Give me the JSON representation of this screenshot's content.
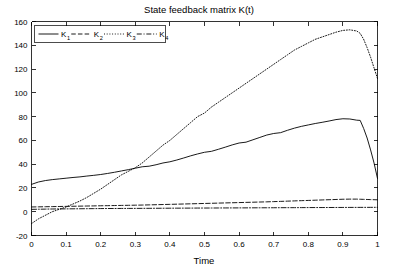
{
  "figure": {
    "width": 398,
    "height": 276,
    "background": "#ffffff",
    "foreground": "#000000"
  },
  "chart_data": {
    "type": "line",
    "title": "State feedback matrix K(t)",
    "xlabel": "Time",
    "ylabel": "",
    "xlim": [
      0,
      1
    ],
    "ylim": [
      -20,
      160
    ],
    "grid": false,
    "legend_position": "upper left",
    "xticks": [
      0,
      0.1,
      0.2,
      0.3,
      0.4,
      0.5,
      0.6,
      0.7,
      0.8,
      0.9,
      1
    ],
    "xticklabels": [
      "0",
      "0.1",
      "0.2",
      "0.3",
      "0.4",
      "0.5",
      "0.6",
      "0.7",
      "0.8",
      "0.9",
      "1"
    ],
    "yticks": [
      -20,
      0,
      20,
      40,
      60,
      80,
      100,
      120,
      140,
      160
    ],
    "yticklabels": [
      "-20",
      "0",
      "20",
      "40",
      "60",
      "80",
      "100",
      "120",
      "140",
      "160"
    ],
    "x": [
      0,
      0.02,
      0.04,
      0.06,
      0.08,
      0.1,
      0.12,
      0.14,
      0.16,
      0.18,
      0.2,
      0.22,
      0.24,
      0.26,
      0.28,
      0.3,
      0.32,
      0.34,
      0.36,
      0.38,
      0.4,
      0.42,
      0.44,
      0.46,
      0.48,
      0.5,
      0.52,
      0.54,
      0.56,
      0.58,
      0.6,
      0.62,
      0.64,
      0.66,
      0.68,
      0.7,
      0.72,
      0.74,
      0.76,
      0.78,
      0.8,
      0.82,
      0.84,
      0.86,
      0.88,
      0.9,
      0.92,
      0.94,
      0.95,
      0.96,
      0.97,
      0.98,
      0.99,
      1
    ],
    "series": [
      {
        "name": "K_1",
        "label": "K",
        "subscript": "1",
        "linestyle": "solid",
        "color": "#000000",
        "values": [
          23,
          25,
          26.2,
          27,
          27.6,
          28.2,
          28.8,
          29.3,
          30,
          30.6,
          31.3,
          32.2,
          33.2,
          34.3,
          35.4,
          36.6,
          37.8,
          38.3,
          39.5,
          41,
          42,
          43.5,
          45.2,
          47,
          48.6,
          50,
          50.8,
          52.5,
          54.3,
          56.2,
          57.8,
          58.5,
          60.5,
          62.5,
          64.5,
          65.8,
          66.5,
          68.5,
          70.3,
          71.8,
          73,
          74.2,
          75.2,
          76.3,
          77.5,
          78.2,
          78,
          77,
          76.8,
          70,
          62,
          52,
          41,
          28
        ]
      },
      {
        "name": "K_2",
        "label": "K",
        "subscript": "2",
        "linestyle": "dashed",
        "color": "#000000",
        "values": [
          4,
          4.1,
          4.2,
          4.3,
          4.4,
          4.5,
          4.6,
          4.7,
          4.8,
          4.9,
          5,
          5.1,
          5.2,
          5.3,
          5.4,
          5.5,
          5.6,
          5.75,
          5.9,
          6.05,
          6.2,
          6.35,
          6.5,
          6.65,
          6.8,
          6.95,
          7.1,
          7.25,
          7.4,
          7.55,
          7.7,
          7.85,
          8,
          8.15,
          8.3,
          8.5,
          8.7,
          8.9,
          9.1,
          9.3,
          9.5,
          9.7,
          9.9,
          10.1,
          10.3,
          10.5,
          10.6,
          10.6,
          10.5,
          10.4,
          10.3,
          10.2,
          10.1,
          10
        ]
      },
      {
        "name": "K_3",
        "label": "K",
        "subscript": "3",
        "linestyle": "dotted",
        "color": "#000000",
        "values": [
          -10,
          -6,
          -3,
          0,
          2,
          4,
          6.5,
          9,
          12,
          15.5,
          19,
          23,
          27,
          31,
          34,
          37,
          41,
          46,
          51,
          56,
          60,
          65,
          70,
          75,
          80,
          83,
          88,
          92,
          96,
          100,
          104,
          108,
          112,
          116,
          120,
          124,
          128,
          132,
          136,
          139,
          142,
          145,
          147,
          149,
          151,
          152.5,
          153,
          152,
          150,
          145,
          138,
          130,
          121,
          112
        ]
      },
      {
        "name": "K_4",
        "label": "K",
        "subscript": "4",
        "linestyle": "dashdot",
        "color": "#000000",
        "values": [
          2,
          2.1,
          2.2,
          2.3,
          2.35,
          2.4,
          2.45,
          2.5,
          2.55,
          2.6,
          2.65,
          2.7,
          2.72,
          2.75,
          2.78,
          2.8,
          2.83,
          2.86,
          2.9,
          2.93,
          2.96,
          3,
          3.02,
          3.05,
          3.08,
          3.1,
          3.12,
          3.15,
          3.18,
          3.2,
          3.22,
          3.25,
          3.28,
          3.3,
          3.32,
          3.35,
          3.38,
          3.4,
          3.42,
          3.45,
          3.48,
          3.5,
          3.52,
          3.55,
          3.58,
          3.6,
          3.62,
          3.64,
          3.65,
          3.66,
          3.67,
          3.68,
          3.69,
          3.7
        ]
      }
    ]
  },
  "legend": {
    "entries": [
      {
        "label": "K",
        "subscript": "1",
        "style": "solid"
      },
      {
        "label": "K",
        "subscript": "2",
        "style": "dashed"
      },
      {
        "label": "K",
        "subscript": "3",
        "style": "dotted"
      },
      {
        "label": "K",
        "subscript": "4",
        "style": "dashdot"
      }
    ]
  }
}
